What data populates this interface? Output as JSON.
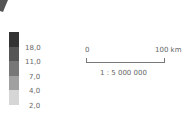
{
  "map_fragment": {
    "corner_shape_color": "#555555"
  },
  "legend": {
    "swatches": [
      {
        "color": "#333333"
      },
      {
        "color": "#555555"
      },
      {
        "color": "#777777"
      },
      {
        "color": "#a0a0a0"
      },
      {
        "color": "#d6d6d6"
      }
    ],
    "labels": [
      "18,0",
      "11,0",
      "7,0",
      "4,0",
      "2,0"
    ]
  },
  "scale_bar": {
    "start_label": "0",
    "end_label": "100 km",
    "ratio": "1 : 5 000 000"
  }
}
